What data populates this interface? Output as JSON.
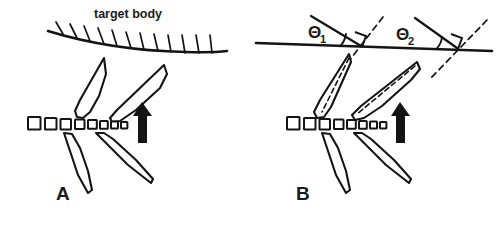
{
  "figure": {
    "background_color": "#ffffff",
    "ink_color": "#141414",
    "width": 497,
    "height": 234
  },
  "panels": [
    {
      "id": "A",
      "label": "A",
      "target_body_label": "target body",
      "surface_type": "hatched-curved-line",
      "hatch_count": 11,
      "square_count": 8,
      "upper_blade_count": 2,
      "lower_blade_count": 2,
      "arrow": {
        "name": "direction-arrow",
        "direction": "up"
      },
      "angle_markers": []
    },
    {
      "id": "B",
      "label": "B",
      "target_body_label": "",
      "surface_type": "plain-straight-line",
      "hatch_count": 0,
      "square_count": 8,
      "upper_blade_count": 2,
      "lower_blade_count": 2,
      "arrow": {
        "name": "direction-arrow",
        "direction": "up"
      },
      "angle_markers": [
        {
          "name": "theta-1",
          "symbol": "Θ",
          "subscript": "1",
          "description": "angle between surface line and first blade axis"
        },
        {
          "name": "theta-2",
          "symbol": "Θ",
          "subscript": "2",
          "description": "angle between surface line and second blade axis"
        }
      ]
    }
  ]
}
